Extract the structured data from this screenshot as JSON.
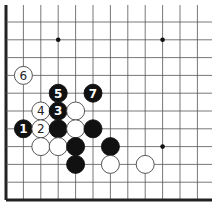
{
  "board": {
    "x0": 6,
    "y0": 22,
    "dx": 17.4,
    "dy": 17.8,
    "cols": 12,
    "rows": 11,
    "right_extent": 212,
    "top_extent": 5,
    "edges": [
      "left",
      "bottom"
    ],
    "line_color": "#555555",
    "edge_color": "#222222",
    "stone_radius": 9,
    "black_color": "#111111",
    "white_color": "#ffffff"
  },
  "star_points": [
    {
      "col": 3,
      "row": 1
    },
    {
      "col": 9,
      "row": 1
    },
    {
      "col": 9,
      "row": 7
    }
  ],
  "stones": [
    {
      "color": "white",
      "col": 1,
      "row": 3,
      "label": "6"
    },
    {
      "color": "black",
      "col": 3,
      "row": 4,
      "label": "5"
    },
    {
      "color": "black",
      "col": 5,
      "row": 4,
      "label": "7"
    },
    {
      "color": "white",
      "col": 2,
      "row": 5,
      "label": "4"
    },
    {
      "color": "black",
      "col": 3,
      "row": 5,
      "label": "3"
    },
    {
      "color": "white",
      "col": 4,
      "row": 5,
      "label": ""
    },
    {
      "color": "black",
      "col": 1,
      "row": 6,
      "label": "1"
    },
    {
      "color": "white",
      "col": 2,
      "row": 6,
      "label": "2"
    },
    {
      "color": "black",
      "col": 3,
      "row": 6,
      "label": ""
    },
    {
      "color": "white",
      "col": 4,
      "row": 6,
      "label": ""
    },
    {
      "color": "black",
      "col": 5,
      "row": 6,
      "label": ""
    },
    {
      "color": "white",
      "col": 2,
      "row": 7,
      "label": ""
    },
    {
      "color": "white",
      "col": 3,
      "row": 7,
      "label": ""
    },
    {
      "color": "black",
      "col": 4,
      "row": 7,
      "label": ""
    },
    {
      "color": "black",
      "col": 6,
      "row": 7,
      "label": ""
    },
    {
      "color": "black",
      "col": 4,
      "row": 8,
      "label": ""
    },
    {
      "color": "white",
      "col": 6,
      "row": 8,
      "label": ""
    },
    {
      "color": "white",
      "col": 8,
      "row": 8,
      "label": ""
    }
  ]
}
